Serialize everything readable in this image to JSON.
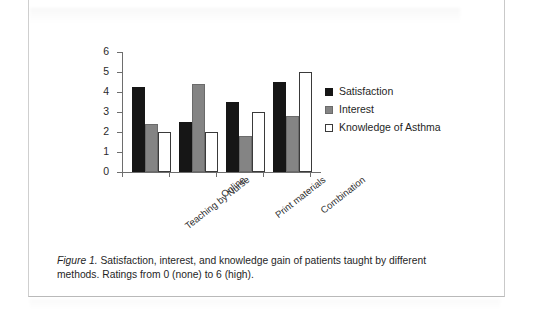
{
  "figure": {
    "caption_label": "Figure 1.",
    "caption_text": " Satisfaction, interest, and knowledge gain of patients taught by different methods. Ratings from 0 (none) to 6 (high)."
  },
  "legend": {
    "position": "right",
    "items": [
      {
        "label": "Satisfaction",
        "color": "#161616",
        "swatch": "filled-black-square"
      },
      {
        "label": "Interest",
        "color": "#848484",
        "swatch": "filled-gray-square"
      },
      {
        "label": "Knowledge of Asthma",
        "color": "#ffffff",
        "swatch": "open-white-square"
      }
    ]
  },
  "chart_data": {
    "type": "bar",
    "title": "",
    "xlabel": "",
    "ylabel": "",
    "ylim": [
      0,
      6
    ],
    "ytick_step": 1,
    "yticks": [
      6,
      5,
      4,
      3,
      2,
      1,
      0
    ],
    "grid": false,
    "categories": [
      "Teaching by Nurse",
      "Online",
      "Print materials",
      "Combination"
    ],
    "series": [
      {
        "name": "Satisfaction",
        "color": "#161616",
        "values": [
          4.25,
          2.5,
          3.5,
          4.5
        ]
      },
      {
        "name": "Interest",
        "color": "#848484",
        "values": [
          2.4,
          4.4,
          1.8,
          2.8
        ]
      },
      {
        "name": "Knowledge of Asthma",
        "color": "#ffffff",
        "values": [
          2.0,
          2.0,
          3.0,
          5.0
        ]
      }
    ]
  }
}
